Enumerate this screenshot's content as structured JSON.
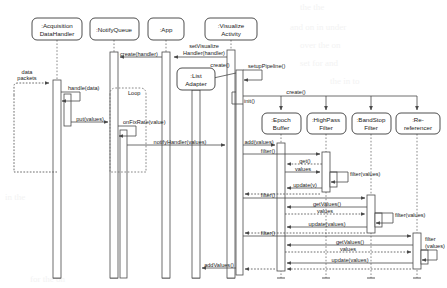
{
  "diagram": {
    "type": "uml-sequence-diagram",
    "background": "#ffffff",
    "line_color": "#4a4a4a",
    "lifeline_color": "#6b6b6b"
  },
  "participants": [
    {
      "id": "acq",
      "label": ":Acquisition\nDataHandler",
      "line1": ":Acquisition",
      "line2": "DataHandler",
      "x": 57,
      "box_y": 18,
      "box_w": 50,
      "box_h": 22,
      "row": 1
    },
    {
      "id": "nq",
      "label": ":NotifyQueue",
      "line1": ":NotifyQueue",
      "line2": "",
      "x": 114,
      "box_y": 18,
      "box_w": 49,
      "box_h": 22,
      "row": 1
    },
    {
      "id": "app",
      "label": ":App",
      "line1": ":App",
      "line2": "",
      "x": 166,
      "box_y": 18,
      "box_w": 36,
      "box_h": 22,
      "row": 1
    },
    {
      "id": "vis",
      "label": ":Visualize\nActivity",
      "line1": ":Visualize",
      "line2": "Activity",
      "x": 231,
      "box_y": 18,
      "box_w": 52,
      "box_h": 22,
      "row": 1
    },
    {
      "id": "list",
      "label": ":List\nAdapter",
      "line1": ":List",
      "line2": "Adapter",
      "x": 196,
      "box_y": 68,
      "box_w": 38,
      "box_h": 22,
      "row": 2
    },
    {
      "id": "epoch",
      "label": ":Epoch\nBuffer",
      "line1": ":Epoch",
      "line2": "Buffer",
      "x": 281,
      "box_y": 113,
      "box_w": 39,
      "box_h": 21,
      "row": 2
    },
    {
      "id": "hp",
      "label": ":HighPass\nFilter",
      "line1": ":HighPass",
      "line2": "Filter",
      "x": 326,
      "box_y": 113,
      "box_w": 39,
      "box_h": 21,
      "row": 2
    },
    {
      "id": "bs",
      "label": ":BandStop\nFilter",
      "line1": ":BandStop",
      "line2": "Filter",
      "x": 371,
      "box_y": 113,
      "box_w": 39,
      "box_h": 21,
      "row": 2
    },
    {
      "id": "reref",
      "label": ":Re-\nreferencer",
      "line1": ":Re-",
      "line2": "referencer",
      "x": 417,
      "box_y": 113,
      "box_w": 44,
      "box_h": 21,
      "row": 2
    }
  ],
  "fragments": [
    {
      "id": "loop",
      "label": "Loop",
      "x": 110,
      "y": 88,
      "w": 36,
      "h": 84
    }
  ],
  "external_labels": [
    {
      "id": "data-packets",
      "line1": "data",
      "line2": "packets",
      "x": 27,
      "y": 78
    }
  ],
  "messages": [
    {
      "id": "m01",
      "label": "create(handler)",
      "from": "app",
      "to": "nq",
      "kind": "call",
      "y": 57
    },
    {
      "id": "m02",
      "label": "setVisualize\nHandler(handler)",
      "line1": "setVisualize",
      "line2": "Handler(handler)",
      "from": "vis",
      "to": "app",
      "kind": "call",
      "y": 57
    },
    {
      "id": "m03",
      "label": "create()",
      "from": "vis",
      "to": "list",
      "kind": "create",
      "y": 68
    },
    {
      "id": "m04",
      "label": "setupPipeline()",
      "from": "vis",
      "to": "vis",
      "kind": "self",
      "y": 74
    },
    {
      "id": "m05",
      "label": "create()",
      "from": "vis",
      "to": "epoch",
      "kind": "create",
      "y": 95
    },
    {
      "id": "m06",
      "label": "init()",
      "from": "vis",
      "to": "vis",
      "kind": "self",
      "y": 102
    },
    {
      "id": "m07",
      "label": "data packets",
      "from": "ext",
      "to": "acq",
      "kind": "async",
      "y": 85
    },
    {
      "id": "m08",
      "label": "handle(data)",
      "from": "acq",
      "to": "acq",
      "kind": "self",
      "y": 100
    },
    {
      "id": "m09",
      "label": "put(values)",
      "from": "acq",
      "to": "nq",
      "kind": "call",
      "y": 122
    },
    {
      "id": "m10",
      "label": "onFixRate(value)",
      "from": "nq",
      "to": "nq",
      "kind": "self",
      "y": 134
    },
    {
      "id": "m11",
      "label": "notifyHandler(values)",
      "from": "nq",
      "to": "vis",
      "kind": "call",
      "y": 145
    },
    {
      "id": "m12",
      "label": "add(values)",
      "from": "vis",
      "to": "epoch",
      "kind": "call",
      "y": 146
    },
    {
      "id": "m13",
      "label": "filter()",
      "from": "vis",
      "to": "hp",
      "kind": "call",
      "y": 155
    },
    {
      "id": "m14",
      "label": "get()",
      "from": "hp",
      "to": "epoch",
      "kind": "return",
      "y": 164
    },
    {
      "id": "m15",
      "label": "values",
      "from": "epoch",
      "to": "hp",
      "kind": "call",
      "y": 173
    },
    {
      "id": "m16",
      "label": "filter(values)",
      "from": "hp",
      "to": "hp",
      "kind": "self",
      "y": 178
    },
    {
      "id": "m17",
      "label": "update(v)",
      "from": "hp",
      "to": "epoch",
      "kind": "call",
      "y": 188
    },
    {
      "id": "m18",
      "label": "filter()",
      "from": "vis",
      "to": "bs",
      "kind": "call",
      "y": 198
    },
    {
      "id": "m19",
      "label": "getValues()",
      "from": "bs",
      "to": "epoch",
      "kind": "call",
      "y": 207
    },
    {
      "id": "m20",
      "label": "values",
      "from": "epoch",
      "to": "bs",
      "kind": "return",
      "y": 216
    },
    {
      "id": "m21",
      "label": "filter(values)",
      "from": "bs",
      "to": "bs",
      "kind": "self",
      "y": 219
    },
    {
      "id": "m22",
      "label": "update(values)",
      "from": "bs",
      "to": "epoch",
      "kind": "call",
      "y": 227
    },
    {
      "id": "m23",
      "label": "filter()",
      "from": "vis",
      "to": "reref",
      "kind": "call",
      "y": 236
    },
    {
      "id": "m24",
      "label": "getValues()",
      "from": "reref",
      "to": "epoch",
      "kind": "call",
      "y": 245
    },
    {
      "id": "m25",
      "label": "values",
      "from": "epoch",
      "to": "reref",
      "kind": "return",
      "y": 254
    },
    {
      "id": "m26",
      "label": "filter\n(values)",
      "line1": "filter",
      "line2": "(values)",
      "from": "reref",
      "to": "reref",
      "kind": "self",
      "y": 252
    },
    {
      "id": "m27",
      "label": "update(values)",
      "from": "reref",
      "to": "epoch",
      "kind": "call",
      "y": 263
    },
    {
      "id": "m28",
      "label": "addValues()",
      "from": "vis",
      "to": "list",
      "kind": "call",
      "y": 268
    }
  ],
  "message_labels": {
    "create_handler": "create(handler)",
    "set_visualize_handler_1": "setVisualize",
    "set_visualize_handler_2": "Handler(handler)",
    "create": "create()",
    "setup_pipeline": "setupPipeline()",
    "init": "init()",
    "data_packets_1": "data",
    "data_packets_2": "packets",
    "handle_data": "handle(data)",
    "put_values": "put(values)",
    "on_fix_rate": "onFixRate(value)",
    "notify_handler": "notifyHandler(values)",
    "add_values_msg": "add(values)",
    "filter": "filter()",
    "get": "get()",
    "values": "values",
    "filter_values": "filter(values)",
    "update_v": "update(v)",
    "get_values": "getValues()",
    "update_values": "update(values)",
    "filter_split_1": "filter",
    "filter_split_2": "(values)",
    "add_values": "addValues()",
    "loop": "Loop"
  }
}
